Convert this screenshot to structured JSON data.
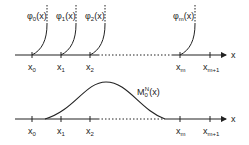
{
  "top_panel": {
    "functions": [
      {
        "label": "φ",
        "sub": "0",
        "arg": "(x)"
      },
      {
        "label": "φ",
        "sub": "1",
        "arg": "(x)"
      },
      {
        "label": "φ",
        "sub": "2",
        "arg": "(x)"
      },
      {
        "label": "φ",
        "sub": "m",
        "arg": "(x)"
      }
    ],
    "ticks": [
      {
        "label": "x",
        "sub": "0"
      },
      {
        "label": "x",
        "sub": "1"
      },
      {
        "label": "x",
        "sub": "2"
      },
      {
        "label": "x",
        "sub": "m"
      },
      {
        "label": "x",
        "sub": "m+1"
      }
    ],
    "axis_label": "x"
  },
  "bottom_panel": {
    "curve_label": {
      "label": "M",
      "sub": "0",
      "sup": "N",
      "arg": "(x)"
    },
    "ticks": [
      {
        "label": "x",
        "sub": "0"
      },
      {
        "label": "x",
        "sub": "1"
      },
      {
        "label": "x",
        "sub": "2"
      },
      {
        "label": "x",
        "sub": "m"
      },
      {
        "label": "x",
        "sub": "m+1"
      }
    ],
    "axis_label": "x"
  },
  "colors": {
    "ink": "#222222",
    "background": "#ffffff"
  }
}
